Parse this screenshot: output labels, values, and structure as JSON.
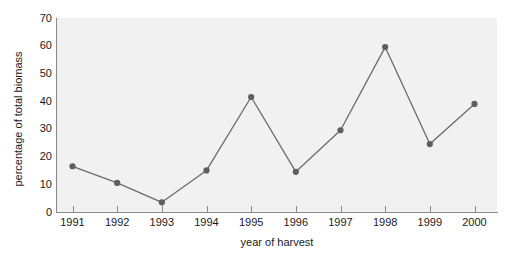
{
  "chart_data": {
    "type": "line",
    "title": "",
    "xlabel": "year of harvest",
    "ylabel": "percentage of total biomass",
    "categories": [
      "1991",
      "1992",
      "1993",
      "1994",
      "1995",
      "1996",
      "1997",
      "1998",
      "1999",
      "2000"
    ],
    "values": [
      16.5,
      10.5,
      3.5,
      15,
      41.5,
      14.5,
      29.5,
      59.5,
      24.5,
      39
    ],
    "series": [
      {
        "name": "percentage of total biomass",
        "values": [
          16.5,
          10.5,
          3.5,
          15,
          41.5,
          14.5,
          29.5,
          59.5,
          24.5,
          39
        ]
      }
    ],
    "ylim": [
      0,
      70
    ],
    "yticks": [
      0,
      10,
      20,
      30,
      40,
      50,
      60,
      70
    ],
    "ytick_labels": [
      "0",
      "10",
      "20",
      "30",
      "40",
      "50",
      "60",
      "70"
    ],
    "xtick_labels": [
      "1991",
      "1992",
      "1993",
      "1994",
      "1995",
      "1996",
      "1997",
      "1998",
      "1999",
      "2000"
    ],
    "grid": false,
    "legend": "none",
    "marker": "circle",
    "colors": {
      "line": "#6b6b6b",
      "marker": "#5e5e5e",
      "panel_background": "#f1f1f1",
      "axis": "#8a8a8a",
      "text": "#1a1a1a",
      "figure_background": "#ffffff"
    }
  }
}
